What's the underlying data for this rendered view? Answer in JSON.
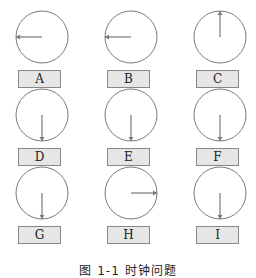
{
  "figure": {
    "caption": "图 1-1  时钟问题",
    "stroke_color": "#7a7a7a",
    "label_bg": "#e6e6e6",
    "clocks": [
      {
        "label": "A",
        "hand": "left"
      },
      {
        "label": "B",
        "hand": "left"
      },
      {
        "label": "C",
        "hand": "up"
      },
      {
        "label": "D",
        "hand": "down"
      },
      {
        "label": "E",
        "hand": "down"
      },
      {
        "label": "F",
        "hand": "down"
      },
      {
        "label": "G",
        "hand": "down"
      },
      {
        "label": "H",
        "hand": "right"
      },
      {
        "label": "I",
        "hand": "down"
      }
    ]
  }
}
